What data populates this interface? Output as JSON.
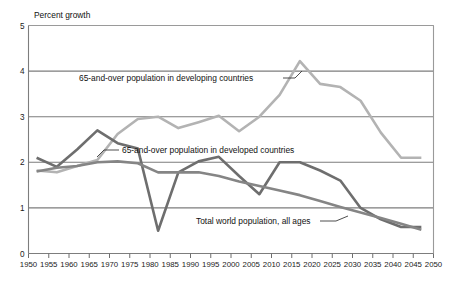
{
  "figure": {
    "y_axis_title": "Percent growth",
    "background_color": "#ffffff"
  },
  "chart_data": {
    "type": "line",
    "title": "",
    "subtitle": "",
    "xlabel": "",
    "ylabel": "Percent growth",
    "xlim": [
      1950,
      2050
    ],
    "ylim": [
      0,
      5
    ],
    "ytick_labels": [
      "0",
      "1",
      "2",
      "3",
      "4",
      "5"
    ],
    "ytick_values": [
      0,
      1,
      2,
      3,
      4,
      5
    ],
    "xtick_labels": [
      "1950",
      "1955",
      "1960",
      "1965",
      "1970",
      "1975",
      "1980",
      "1985",
      "1990",
      "1995",
      "2000",
      "2005",
      "2010",
      "2015",
      "2020",
      "2025",
      "2030",
      "2035",
      "2040",
      "2045",
      "2050"
    ],
    "xtick_values": [
      1950,
      1955,
      1960,
      1965,
      1970,
      1975,
      1980,
      1985,
      1990,
      1995,
      2000,
      2005,
      2010,
      2015,
      2020,
      2025,
      2030,
      2035,
      2040,
      2045,
      2050
    ],
    "grid": "horizontal",
    "legend_position": "inline-annotations",
    "series": [
      {
        "name": "65-and-over population in developing countries",
        "color": "#b3b3b3",
        "linewidth": 2.6,
        "x": [
          1952,
          1957,
          1962,
          1967,
          1972,
          1977,
          1982,
          1987,
          1992,
          1997,
          2002,
          2007,
          2012,
          2017,
          2022,
          2027,
          2032,
          2037,
          2042,
          2047
        ],
        "values": [
          1.82,
          1.78,
          1.92,
          2.05,
          2.62,
          2.95,
          3.0,
          2.75,
          2.88,
          3.02,
          2.68,
          3.0,
          3.48,
          4.22,
          3.72,
          3.65,
          3.35,
          2.65,
          2.1,
          2.1
        ]
      },
      {
        "name": "65-and-over population in developed countries",
        "color": "#6e6e6e",
        "linewidth": 2.6,
        "x": [
          1952,
          1957,
          1962,
          1967,
          1972,
          1977,
          1982,
          1987,
          1992,
          1997,
          2002,
          2007,
          2012,
          2017,
          2022,
          2027,
          2032,
          2037,
          2042,
          2047
        ],
        "values": [
          2.1,
          1.9,
          2.28,
          2.7,
          2.42,
          2.3,
          0.5,
          1.78,
          2.02,
          2.12,
          1.7,
          1.3,
          2.0,
          2.0,
          1.82,
          1.6,
          1.0,
          0.75,
          0.58,
          0.58
        ]
      },
      {
        "name": "Total world population, all ages",
        "color": "#858585",
        "linewidth": 2.6,
        "x": [
          1952,
          1957,
          1962,
          1967,
          1972,
          1977,
          1982,
          1987,
          1992,
          1997,
          2002,
          2007,
          2012,
          2017,
          2022,
          2027,
          2032,
          2037,
          2042,
          2047
        ],
        "values": [
          1.8,
          1.88,
          1.92,
          2.0,
          2.02,
          1.98,
          1.78,
          1.78,
          1.78,
          1.7,
          1.58,
          1.48,
          1.38,
          1.28,
          1.15,
          1.02,
          0.9,
          0.78,
          0.65,
          0.52
        ]
      }
    ],
    "annotations": [
      {
        "text": "65-and-over population in developing countries",
        "series": "65-and-over population in developing countries"
      },
      {
        "text": "65-and-over population in developed countries",
        "series": "65-and-over population in developed countries"
      },
      {
        "text": "Total world population, all ages",
        "series": "Total world population, all ages"
      }
    ]
  }
}
